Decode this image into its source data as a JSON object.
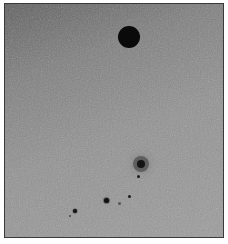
{
  "image": {
    "description": "Grayscale micrograph with scattered dark particles",
    "background_gradient": [
      "#5e5e5e",
      "#9c9c9c"
    ],
    "border_color": "#3a3a3a"
  },
  "particles": [
    {
      "name": "large-particle",
      "cx": 129,
      "cy": 37,
      "r": 11,
      "color": "#0a0a0a",
      "halo": 0
    },
    {
      "name": "halo-particle",
      "cx": 141,
      "cy": 164,
      "r": 4,
      "color": "#151515",
      "halo": 8
    },
    {
      "name": "small-particle-1",
      "cx": 138,
      "cy": 176,
      "r": 1.5,
      "color": "#1a1a1a",
      "halo": 0
    },
    {
      "name": "small-particle-2",
      "cx": 106,
      "cy": 200,
      "r": 2.5,
      "color": "#111111",
      "halo": 1.5
    },
    {
      "name": "small-particle-3",
      "cx": 129,
      "cy": 196,
      "r": 1.5,
      "color": "#1a1a1a",
      "halo": 0
    },
    {
      "name": "faint-particle-1",
      "cx": 119,
      "cy": 203,
      "r": 1.5,
      "color": "#555555",
      "halo": 0
    },
    {
      "name": "small-particle-4",
      "cx": 75,
      "cy": 211,
      "r": 2,
      "color": "#151515",
      "halo": 1
    },
    {
      "name": "faint-particle-2",
      "cx": 70,
      "cy": 216,
      "r": 1,
      "color": "#444444",
      "halo": 0
    }
  ]
}
